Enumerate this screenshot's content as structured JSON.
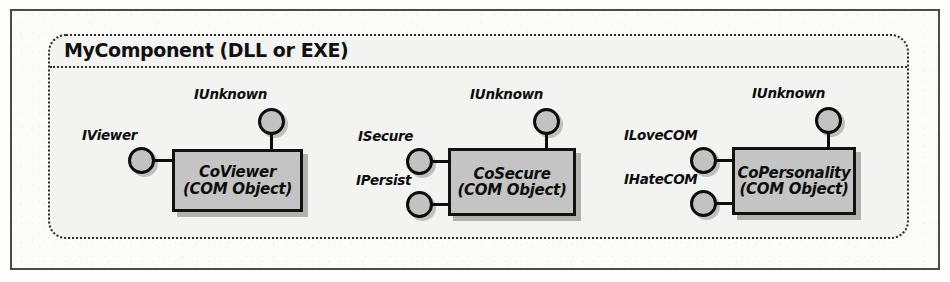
{
  "figure": {
    "kind": "com-component-lollipop-diagram",
    "component": {
      "title": "MyComponent (DLL or EXE)"
    },
    "objects": [
      {
        "name": "CoViewer",
        "subtitle": "(COM Object)",
        "box": {
          "x": 172,
          "y": 149,
          "w": 131,
          "h": 63
        },
        "top_interface": {
          "label": "IUnknown",
          "circle": {
            "cx": 271,
            "cy": 121
          },
          "label_pos": {
            "x": 194,
            "y": 86
          }
        },
        "left_interfaces": [
          {
            "label": "IViewer",
            "circle": {
              "cx": 141,
              "cy": 160
            },
            "label_pos": {
              "x": 82,
              "y": 127
            }
          }
        ]
      },
      {
        "name": "CoSecure",
        "subtitle": "(COM Object)",
        "box": {
          "x": 448,
          "y": 148,
          "w": 128,
          "h": 68
        },
        "top_interface": {
          "label": "IUnknown",
          "circle": {
            "cx": 546,
            "cy": 121
          },
          "label_pos": {
            "x": 470,
            "y": 86
          }
        },
        "left_interfaces": [
          {
            "label": "ISecure",
            "circle": {
              "cx": 419,
              "cy": 161
            },
            "label_pos": {
              "x": 358,
              "y": 128
            }
          },
          {
            "label": "IPersist",
            "circle": {
              "cx": 419,
              "cy": 204
            },
            "label_pos": {
              "x": 356,
              "y": 172
            }
          }
        ]
      },
      {
        "name": "CoPersonality",
        "subtitle": "(COM Object)",
        "box": {
          "x": 732,
          "y": 147,
          "w": 124,
          "h": 68
        },
        "top_interface": {
          "label": "IUnknown",
          "circle": {
            "cx": 828,
            "cy": 120
          },
          "label_pos": {
            "x": 752,
            "y": 85
          }
        },
        "left_interfaces": [
          {
            "label": "ILoveCOM",
            "circle": {
              "cx": 703,
              "cy": 160
            },
            "label_pos": {
              "x": 624,
              "y": 127
            }
          },
          {
            "label": "IHateCOM",
            "circle": {
              "cx": 703,
              "cy": 203
            },
            "label_pos": {
              "x": 624,
              "y": 171
            }
          }
        ]
      }
    ],
    "colors": {
      "box_fill": "#c4c4c4",
      "circle_fill": "#c2c2c2",
      "stroke": "#0d0d0d",
      "component_fill": "#f3f3f1",
      "page_frame": "#4a4a4a"
    }
  }
}
